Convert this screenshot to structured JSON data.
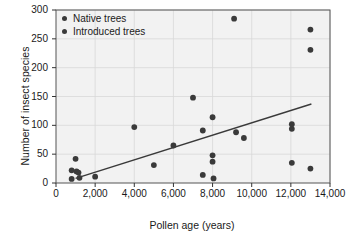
{
  "chart_data": {
    "type": "scatter",
    "title": "",
    "xlabel": "Pollen age (years)",
    "ylabel": "Number of insect species",
    "xlim": [
      0,
      14000
    ],
    "ylim": [
      0,
      300
    ],
    "xticks": [
      "0",
      "2,000",
      "4,000",
      "6,000",
      "8,000",
      "10,000",
      "12,000",
      "14,000"
    ],
    "xtick_values": [
      0,
      2000,
      4000,
      6000,
      8000,
      10000,
      12000,
      14000
    ],
    "yticks": [
      "0",
      "50",
      "100",
      "150",
      "200",
      "250",
      "300"
    ],
    "ytick_values": [
      0,
      50,
      100,
      150,
      200,
      250,
      300
    ],
    "grid": true,
    "legend_position": "top-left",
    "legend": [
      "Native trees",
      "Introduced trees"
    ],
    "marker_color": "#3a3a3a",
    "trendline_color": "#3a3a3a",
    "plot_background": "#f2f2f2",
    "grid_color": "#d8d8d8",
    "points": [
      {
        "x": 800,
        "y": 22
      },
      {
        "x": 800,
        "y": 7
      },
      {
        "x": 1000,
        "y": 42
      },
      {
        "x": 1050,
        "y": 20
      },
      {
        "x": 1150,
        "y": 18
      },
      {
        "x": 1200,
        "y": 9
      },
      {
        "x": 2000,
        "y": 11
      },
      {
        "x": 4000,
        "y": 97
      },
      {
        "x": 5000,
        "y": 31
      },
      {
        "x": 6000,
        "y": 65
      },
      {
        "x": 7000,
        "y": 148
      },
      {
        "x": 7500,
        "y": 91
      },
      {
        "x": 7500,
        "y": 14
      },
      {
        "x": 8000,
        "y": 114
      },
      {
        "x": 8000,
        "y": 48
      },
      {
        "x": 8000,
        "y": 37
      },
      {
        "x": 8050,
        "y": 8
      },
      {
        "x": 9100,
        "y": 285
      },
      {
        "x": 9200,
        "y": 88
      },
      {
        "x": 9600,
        "y": 78
      },
      {
        "x": 12050,
        "y": 102
      },
      {
        "x": 12050,
        "y": 94
      },
      {
        "x": 12050,
        "y": 35
      },
      {
        "x": 13000,
        "y": 266
      },
      {
        "x": 13000,
        "y": 231
      },
      {
        "x": 13000,
        "y": 25
      }
    ],
    "trendline": {
      "x0": 1000,
      "y0": 8,
      "x1": 13050,
      "y1": 137
    }
  }
}
